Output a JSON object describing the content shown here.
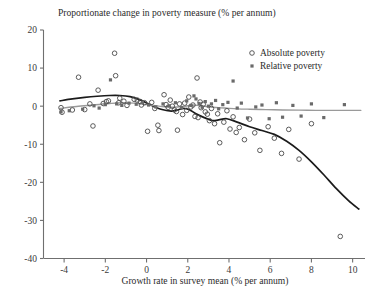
{
  "chart_data": {
    "type": "scatter",
    "title": "Proportionate change in poverty measure (% per annum)",
    "xlabel": "Growth rate in survey mean (% per annum)",
    "ylabel": "",
    "xlim": [
      -5.0,
      10.6
    ],
    "ylim": [
      -40,
      20
    ],
    "xticks": [
      -4,
      -2,
      0,
      2,
      4,
      6,
      8,
      10
    ],
    "xtick_labels": [
      "-4",
      "-2",
      "0",
      "2",
      "4",
      "6",
      "8",
      "10"
    ],
    "yticks": [
      20,
      10,
      0,
      -10,
      -20,
      -30,
      -40
    ],
    "ytick_labels": [
      "20",
      "10",
      "0",
      "-10",
      "-20",
      "-30",
      "-40"
    ],
    "grid": false,
    "legend_position": "top-right",
    "legend": [
      {
        "name": "Absolute poverty",
        "marker": "open-circle",
        "color": "#4a4a4a"
      },
      {
        "name": "Relative poverty",
        "marker": "filled-square",
        "color": "#6a6a6a"
      }
    ],
    "series": [
      {
        "name": "Absolute poverty",
        "marker": "open-circle",
        "points": [
          [
            -4.15,
            -0.4
          ],
          [
            -4.1,
            -1.6
          ],
          [
            -3.6,
            -1.0
          ],
          [
            -3.3,
            7.6
          ],
          [
            -3.0,
            -0.9
          ],
          [
            -2.75,
            0.6
          ],
          [
            -2.6,
            -5.2
          ],
          [
            -2.35,
            4.2
          ],
          [
            -2.1,
            0.7
          ],
          [
            -1.95,
            1.2
          ],
          [
            -1.85,
            1.4
          ],
          [
            -1.55,
            13.9
          ],
          [
            -1.5,
            8.0
          ],
          [
            -1.35,
            0.9
          ],
          [
            -1.3,
            2.1
          ],
          [
            -1.1,
            1.3
          ],
          [
            -0.95,
            0.2
          ],
          [
            -0.6,
            1.8
          ],
          [
            -0.45,
            1.6
          ],
          [
            -0.3,
            1.2
          ],
          [
            -0.25,
            0.3
          ],
          [
            -0.1,
            0.9
          ],
          [
            0.05,
            -6.6
          ],
          [
            0.25,
            1.0
          ],
          [
            0.4,
            -0.6
          ],
          [
            0.55,
            -5.0
          ],
          [
            0.6,
            -6.4
          ],
          [
            0.85,
            3.0
          ],
          [
            0.95,
            0.4
          ],
          [
            1.05,
            -0.3
          ],
          [
            1.15,
            1.6
          ],
          [
            1.25,
            0.0
          ],
          [
            1.35,
            -1.0
          ],
          [
            1.45,
            -1.4
          ],
          [
            1.5,
            -6.3
          ],
          [
            1.6,
            0.6
          ],
          [
            1.75,
            -2.2
          ],
          [
            1.85,
            0.8
          ],
          [
            1.95,
            -1.1
          ],
          [
            2.05,
            2.4
          ],
          [
            2.15,
            -0.2
          ],
          [
            2.25,
            0.3
          ],
          [
            2.35,
            -2.7
          ],
          [
            2.45,
            7.4
          ],
          [
            2.5,
            -3.0
          ],
          [
            2.6,
            1.1
          ],
          [
            2.65,
            -0.4
          ],
          [
            2.75,
            0.5
          ],
          [
            2.85,
            -1.5
          ],
          [
            2.95,
            -2.1
          ],
          [
            3.05,
            -3.8
          ],
          [
            3.15,
            -0.6
          ],
          [
            3.3,
            -4.6
          ],
          [
            3.45,
            -2.0
          ],
          [
            3.55,
            -9.6
          ],
          [
            3.75,
            -4.2
          ],
          [
            3.9,
            -1.2
          ],
          [
            4.05,
            -6.0
          ],
          [
            4.2,
            -2.8
          ],
          [
            4.35,
            -6.9
          ],
          [
            4.5,
            -5.6
          ],
          [
            4.75,
            -8.8
          ],
          [
            5.0,
            -3.4
          ],
          [
            5.25,
            -7.0
          ],
          [
            5.5,
            -11.6
          ],
          [
            5.9,
            -5.4
          ],
          [
            6.2,
            -8.4
          ],
          [
            6.55,
            -12.4
          ],
          [
            6.9,
            -6.1
          ],
          [
            7.4,
            -13.9
          ],
          [
            8.0,
            -4.6
          ],
          [
            9.4,
            -34.2
          ]
        ]
      },
      {
        "name": "Relative poverty",
        "marker": "filled-square",
        "points": [
          [
            -4.15,
            -1.5
          ],
          [
            -3.75,
            -1.2
          ],
          [
            -3.1,
            -0.8
          ],
          [
            -2.55,
            0.1
          ],
          [
            -2.3,
            -0.5
          ],
          [
            -2.0,
            0.4
          ],
          [
            -1.75,
            6.9
          ],
          [
            -1.45,
            0.6
          ],
          [
            -1.2,
            0.2
          ],
          [
            -0.85,
            0.8
          ],
          [
            -0.5,
            0.5
          ],
          [
            -0.2,
            1.0
          ],
          [
            0.1,
            0.3
          ],
          [
            0.45,
            -0.2
          ],
          [
            0.8,
            0.6
          ],
          [
            1.1,
            0.1
          ],
          [
            1.4,
            0.9
          ],
          [
            1.7,
            -0.4
          ],
          [
            1.95,
            1.4
          ],
          [
            2.15,
            0.2
          ],
          [
            2.3,
            2.7
          ],
          [
            2.4,
            1.9
          ],
          [
            2.55,
            0.7
          ],
          [
            2.7,
            -0.3
          ],
          [
            2.85,
            1.2
          ],
          [
            3.0,
            0.0
          ],
          [
            3.15,
            0.6
          ],
          [
            3.35,
            1.5
          ],
          [
            3.5,
            -0.7
          ],
          [
            3.7,
            0.4
          ],
          [
            3.95,
            1.0
          ],
          [
            4.2,
            6.6
          ],
          [
            4.4,
            -0.5
          ],
          [
            4.6,
            0.8
          ],
          [
            4.9,
            -3.1
          ],
          [
            5.3,
            -0.2
          ],
          [
            5.6,
            0.3
          ],
          [
            5.95,
            -3.3
          ],
          [
            6.3,
            0.9
          ],
          [
            6.6,
            -2.9
          ],
          [
            7.1,
            0.2
          ],
          [
            7.5,
            -2.6
          ],
          [
            8.0,
            0.6
          ],
          [
            8.6,
            -3.0
          ],
          [
            9.6,
            0.4
          ]
        ]
      }
    ],
    "fitted_curves": [
      {
        "name": "Absolute poverty fit",
        "color": "#1b1b1b",
        "points": [
          [
            -4.2,
            1.4
          ],
          [
            -3.6,
            1.9
          ],
          [
            -3.0,
            2.3
          ],
          [
            -2.4,
            2.6
          ],
          [
            -1.8,
            2.8
          ],
          [
            -1.3,
            2.8
          ],
          [
            -0.8,
            2.5
          ],
          [
            -0.3,
            1.6
          ],
          [
            0.2,
            0.3
          ],
          [
            0.7,
            -0.8
          ],
          [
            1.2,
            -1.3
          ],
          [
            1.5,
            -1.0
          ],
          [
            1.8,
            -0.6
          ],
          [
            2.1,
            -1.0
          ],
          [
            2.4,
            -2.0
          ],
          [
            2.8,
            -3.0
          ],
          [
            3.2,
            -3.8
          ],
          [
            3.5,
            -3.6
          ],
          [
            3.9,
            -3.3
          ],
          [
            4.4,
            -4.2
          ],
          [
            5.0,
            -5.4
          ],
          [
            5.6,
            -6.4
          ],
          [
            6.2,
            -7.4
          ],
          [
            6.8,
            -9.2
          ],
          [
            7.4,
            -11.6
          ],
          [
            8.0,
            -14.6
          ],
          [
            8.6,
            -18.0
          ],
          [
            9.2,
            -21.6
          ],
          [
            9.8,
            -24.8
          ],
          [
            10.3,
            -27.0
          ]
        ]
      },
      {
        "name": "Relative poverty fit",
        "color": "#9a9a9a",
        "points": [
          [
            -4.2,
            -0.6
          ],
          [
            -3.4,
            -0.1
          ],
          [
            -2.6,
            0.3
          ],
          [
            -1.8,
            0.7
          ],
          [
            -1.2,
            0.9
          ],
          [
            -0.6,
            0.8
          ],
          [
            0.0,
            0.4
          ],
          [
            0.6,
            0.0
          ],
          [
            1.2,
            -0.3
          ],
          [
            1.8,
            -0.1
          ],
          [
            2.2,
            0.3
          ],
          [
            2.6,
            0.1
          ],
          [
            3.2,
            -0.3
          ],
          [
            3.8,
            -0.5
          ],
          [
            4.4,
            -0.7
          ],
          [
            5.0,
            -0.8
          ],
          [
            5.8,
            -0.9
          ],
          [
            6.6,
            -1.0
          ],
          [
            7.4,
            -1.05
          ],
          [
            8.2,
            -1.1
          ],
          [
            9.0,
            -1.1
          ],
          [
            9.8,
            -1.1
          ],
          [
            10.4,
            -1.1
          ]
        ]
      }
    ]
  }
}
